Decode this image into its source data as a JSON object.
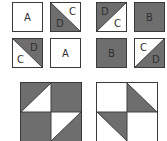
{
  "colors": {
    "dark": "#6e6e6e",
    "light": "#ffffff",
    "border": "#3a3a3a",
    "text": "#2e2e2e"
  },
  "tiles": [
    {
      "id": 1,
      "type": "solid-light",
      "label": "A"
    },
    {
      "id": 2,
      "type": "split-tl-br",
      "dark_side": "bottom-left",
      "labels": {
        "light": "C",
        "dark": "D"
      }
    },
    {
      "id": 3,
      "type": "split-bl-tr",
      "dark_side": "top-left",
      "labels": {
        "dark": "D",
        "light": "C"
      }
    },
    {
      "id": 4,
      "type": "solid-dark",
      "label": "B"
    },
    {
      "id": 5,
      "type": "split-tl-br",
      "dark_side": "top-right",
      "labels": {
        "dark": "D",
        "light": "C"
      }
    },
    {
      "id": 6,
      "type": "solid-light",
      "label": "A"
    },
    {
      "id": 7,
      "type": "solid-dark",
      "label": "B"
    },
    {
      "id": 8,
      "type": "split-bl-tr",
      "dark_side": "bottom-right",
      "labels": {
        "light": "C",
        "dark": "D"
      }
    }
  ],
  "blocks": [
    {
      "id": "left",
      "quadrants": [
        "dark-with-light-triangle-bottom-right",
        "dark",
        "dark",
        "light-triangle-top-left-on-dark"
      ]
    },
    {
      "id": "right",
      "quadrants": [
        "light",
        "dark-triangle-bottom-left",
        "dark-triangle-top-right",
        "light"
      ]
    }
  ],
  "labels": {
    "t1": "A",
    "t2_light": "C",
    "t2_dark": "D",
    "t3_dark": "D",
    "t3_light": "C",
    "t4": "B",
    "t5_dark": "D",
    "t5_light": "C",
    "t6": "A",
    "t7": "B",
    "t8_light": "C",
    "t8_dark": "D"
  }
}
